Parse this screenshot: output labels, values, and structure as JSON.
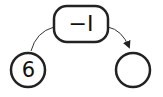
{
  "diagram": {
    "type": "number-operation-flow",
    "operation": {
      "label": "−I",
      "icon": "operation-box"
    },
    "input": {
      "value": "6"
    },
    "output": {
      "value": ""
    },
    "colors": {
      "stroke": "#222222",
      "background": "#ffffff"
    }
  }
}
